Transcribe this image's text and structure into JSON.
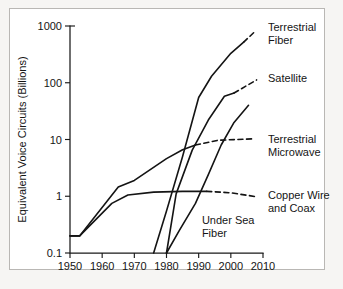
{
  "chart_data": {
    "type": "line",
    "title": "",
    "xlabel": "",
    "ylabel": "Equivalent Voice Circuits (Billions)",
    "xlim": [
      1950,
      2010
    ],
    "ylim": [
      0.1,
      1000
    ],
    "yscale": "log",
    "xscale": "linear",
    "grid": false,
    "legend_position": "right-inline-labels",
    "xticks": [
      "1950",
      "1960",
      "1970",
      "1980",
      "1990",
      "2000",
      "2010"
    ],
    "xtick_values": [
      1950,
      1960,
      1970,
      1980,
      1990,
      2000,
      2010
    ],
    "yticks": [
      "0.1",
      "1",
      "10",
      "100",
      "1000"
    ],
    "ytick_values": [
      0.1,
      1,
      10,
      100,
      1000
    ],
    "series": [
      {
        "name": "Terrestrial Fiber",
        "label": "Terrestrial Fiber",
        "label_lines": [
          "Terrestrial",
          "Fiber"
        ],
        "style": "solid-then-dashed",
        "solid_points": [
          {
            "x": 1976.0,
            "y": 0.1
          },
          {
            "x": 1980.0,
            "y": 0.55
          },
          {
            "x": 1985.0,
            "y": 5.0
          },
          {
            "x": 1990.0,
            "y": 55.0
          },
          {
            "x": 1994.0,
            "y": 130.0
          },
          {
            "x": 2000.0,
            "y": 330.0
          },
          {
            "x": 2004.0,
            "y": 520.0
          }
        ],
        "dashed_points": [
          {
            "x": 2004.0,
            "y": 520.0
          },
          {
            "x": 2007.5,
            "y": 800.0
          }
        ]
      },
      {
        "name": "Satellite",
        "label": "Satellite",
        "label_lines": [
          "Satellite"
        ],
        "style": "solid-then-dashed",
        "solid_points": [
          {
            "x": 1980.0,
            "y": 0.1
          },
          {
            "x": 1983.0,
            "y": 1.1
          },
          {
            "x": 1988.0,
            "y": 6.5
          },
          {
            "x": 1993.0,
            "y": 22.0
          },
          {
            "x": 1998.0,
            "y": 58.0
          },
          {
            "x": 2001.0,
            "y": 66.0
          }
        ],
        "dashed_points": [
          {
            "x": 2001.0,
            "y": 66.0
          },
          {
            "x": 2008.0,
            "y": 112.0
          }
        ]
      },
      {
        "name": "Terrestrial Microwave",
        "label": "Terrestrial Microwave",
        "label_lines": [
          "Terrestrial",
          "Microwave"
        ],
        "style": "solid-then-dashed",
        "solid_points": [
          {
            "x": 1950.0,
            "y": 0.2
          },
          {
            "x": 1953.0,
            "y": 0.2
          },
          {
            "x": 1965.0,
            "y": 1.45
          },
          {
            "x": 1970.0,
            "y": 1.9
          },
          {
            "x": 1980.0,
            "y": 4.6
          },
          {
            "x": 1985.0,
            "y": 6.6
          },
          {
            "x": 1989.0,
            "y": 8.0
          }
        ],
        "dashed_points": [
          {
            "x": 1989.0,
            "y": 8.0
          },
          {
            "x": 1996.0,
            "y": 9.7
          },
          {
            "x": 2007.5,
            "y": 10.3
          }
        ]
      },
      {
        "name": "Copper Wire and Coax",
        "label": "Copper Wire and Coax",
        "label_lines": [
          "Copper Wire",
          "and Coax"
        ],
        "style": "solid-then-dashed",
        "solid_points": [
          {
            "x": 1950.0,
            "y": 0.2
          },
          {
            "x": 1953.0,
            "y": 0.2
          },
          {
            "x": 1963.0,
            "y": 0.75
          },
          {
            "x": 1968.0,
            "y": 1.05
          },
          {
            "x": 1976.0,
            "y": 1.18
          },
          {
            "x": 1985.0,
            "y": 1.22
          },
          {
            "x": 1992.5,
            "y": 1.22
          }
        ],
        "dashed_points": [
          {
            "x": 1992.5,
            "y": 1.22
          },
          {
            "x": 2000.0,
            "y": 1.15
          },
          {
            "x": 2008.0,
            "y": 0.98
          }
        ]
      },
      {
        "name": "Under Sea Fiber",
        "label": "Under Sea Fiber",
        "label_lines": [
          "Under Sea",
          "Fiber"
        ],
        "style": "solid",
        "solid_points": [
          {
            "x": 1980.0,
            "y": 0.1
          },
          {
            "x": 1984.0,
            "y": 0.25
          },
          {
            "x": 1989.0,
            "y": 0.75
          },
          {
            "x": 1993.0,
            "y": 2.4
          },
          {
            "x": 1997.0,
            "y": 8.0
          },
          {
            "x": 2001.0,
            "y": 20.0
          },
          {
            "x": 2005.5,
            "y": 40.0
          }
        ],
        "dashed_points": []
      }
    ],
    "annotations": [
      {
        "text": "Under Sea Fiber",
        "x": 1991.0,
        "y": 0.33,
        "placement": "in-plot"
      }
    ]
  },
  "colors": {
    "line": "#141414",
    "axis": "#1a1a1a",
    "plot_background": "#ffffff",
    "page_background": "#f4f3f1",
    "frame_border": "#b9b7b4",
    "text": "#151515"
  }
}
